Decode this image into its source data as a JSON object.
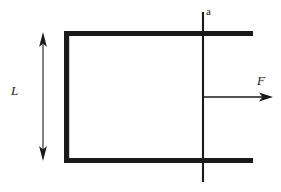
{
  "figure": {
    "kind": "mechanics-free-body-diagram",
    "background_color": "#ffffff",
    "stroke_color": "#1a1a1a",
    "width": 281,
    "height": 192,
    "labels": {
      "length_label": "L",
      "force_label": "F",
      "axis_label": "a"
    },
    "members": {
      "top_beam": {
        "x1": 64,
        "y1": 33.5,
        "x2": 253,
        "y2": 33.5,
        "thickness": 5
      },
      "bottom_beam": {
        "x1": 64,
        "y1": 160.5,
        "x2": 253,
        "y2": 160.5,
        "thickness": 5
      },
      "left_column": {
        "x1": 66.5,
        "y1": 31,
        "x2": 66.5,
        "y2": 163,
        "thickness": 5
      }
    },
    "axis_line": {
      "x": 203,
      "y1": 12,
      "y2": 182,
      "thickness": 2
    },
    "dimension_arrow": {
      "x": 43,
      "y1": 33,
      "y2": 160,
      "thickness": 1,
      "heads": "both"
    },
    "force_arrow": {
      "x1": 203,
      "y1": 97,
      "x2": 273,
      "y2": 97,
      "thickness": 1.4,
      "heads": "end"
    }
  }
}
